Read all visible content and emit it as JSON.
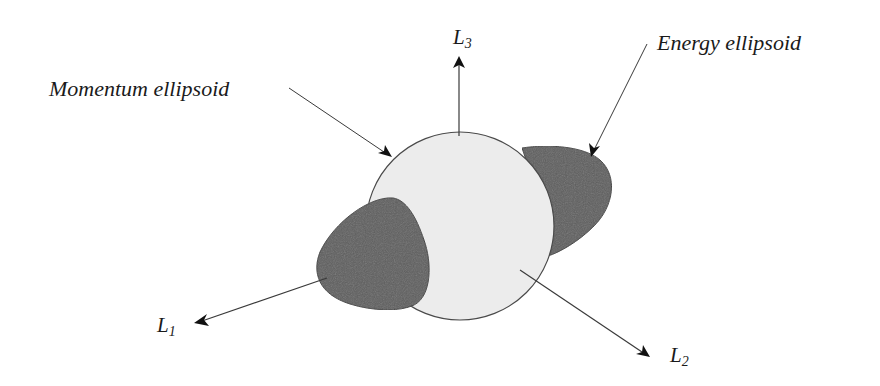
{
  "diagram": {
    "labels": {
      "momentum": "Momentum ellipsoid",
      "energy": "Energy ellipsoid"
    },
    "axes": {
      "L1": {
        "base": "L",
        "sub": "1"
      },
      "L2": {
        "base": "L",
        "sub": "2"
      },
      "L3": {
        "base": "L",
        "sub": "3"
      }
    },
    "colors": {
      "momentum_fill": "#ececec",
      "energy_fill": "#5e5e5e",
      "stroke": "#3a3a3a",
      "text": "#1a1a1a"
    }
  }
}
